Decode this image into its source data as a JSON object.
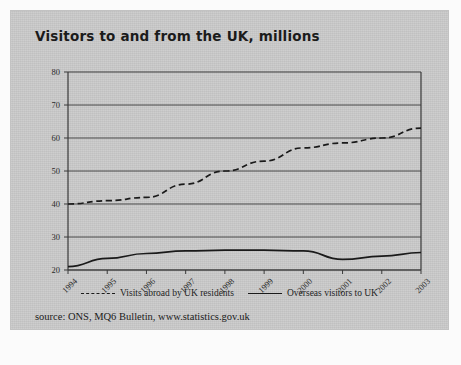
{
  "figure": {
    "title": "Visitors to and from the UK, millions",
    "source": "source: ONS, MQ6 Bulletin, www.statistics.gov.uk"
  },
  "legend": {
    "items": [
      {
        "label": "Visits abroad by UK residents",
        "style": "dashed"
      },
      {
        "label": "Overseas visitors to UK",
        "style": "solid"
      }
    ]
  },
  "chart_data": {
    "type": "line",
    "title": "Visitors to and from the UK, millions",
    "xlabel": "",
    "ylabel": "millions",
    "x": [
      "1994",
      "1995",
      "1996",
      "1997",
      "1998",
      "1999",
      "2000",
      "2001",
      "2002",
      "2003"
    ],
    "xlim": [
      1994,
      2003
    ],
    "ylim": [
      20,
      80
    ],
    "yticks": [
      20,
      30,
      40,
      50,
      60,
      70,
      80
    ],
    "grid": "horizontal",
    "legend_position": "bottom",
    "series": [
      {
        "name": "Visits abroad by UK residents",
        "style": "dashed",
        "color": "#1a1a1a",
        "values": [
          40,
          41,
          42,
          46,
          50,
          53,
          57,
          58.5,
          60,
          63
        ]
      },
      {
        "name": "Overseas visitors to UK",
        "style": "solid",
        "color": "#1a1a1a",
        "values": [
          21,
          23.5,
          25,
          25.8,
          26,
          26,
          25.8,
          23.2,
          24.2,
          25.3
        ]
      }
    ]
  }
}
